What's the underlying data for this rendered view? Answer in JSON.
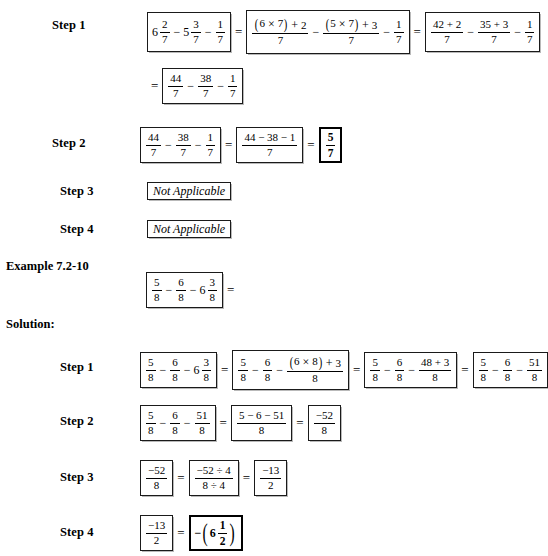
{
  "document": {
    "example_heading": "Example 7.2-10",
    "solution_heading": "Solution:",
    "equals": "=",
    "minus": "−",
    "times": "×",
    "plus": "+",
    "divide": "÷",
    "not_applicable": "Not Applicable"
  },
  "example_1": {
    "step1": {
      "label": "Step 1",
      "box1": {
        "m1_whole": "6",
        "m1_num": "2",
        "m1_den": "7",
        "m2_whole": "5",
        "m2_num": "3",
        "m2_den": "7",
        "f3_num": "1",
        "f3_den": "7"
      },
      "box2": {
        "f1_num": "(6 × 7) + 2",
        "f1_a": "6",
        "f1_b": "7",
        "f1_add": "2",
        "f1_den": "7",
        "f2_a": "5",
        "f2_b": "7",
        "f2_add": "3",
        "f2_den": "7",
        "f3_num": "1",
        "f3_den": "7"
      },
      "box3": {
        "f1_num": "42 + 2",
        "f1_den": "7",
        "f2_num": "35 + 3",
        "f2_den": "7",
        "f3_num": "1",
        "f3_den": "7"
      },
      "box4": {
        "f1_num": "44",
        "f1_den": "7",
        "f2_num": "38",
        "f2_den": "7",
        "f3_num": "1",
        "f3_den": "7"
      }
    },
    "step2": {
      "label": "Step 2",
      "box1": {
        "f1_num": "44",
        "f1_den": "7",
        "f2_num": "38",
        "f2_den": "7",
        "f3_num": "1",
        "f3_den": "7"
      },
      "box2": {
        "num": "44 − 38 − 1",
        "den": "7"
      },
      "box3": {
        "num": "5",
        "den": "7"
      }
    },
    "step3": {
      "label": "Step 3",
      "value": "Not Applicable"
    },
    "step4": {
      "label": "Step 4",
      "value": "Not Applicable"
    }
  },
  "example_2": {
    "problem": {
      "f1_num": "5",
      "f1_den": "8",
      "f2_num": "6",
      "f2_den": "8",
      "m_whole": "6",
      "m_num": "3",
      "m_den": "8"
    },
    "step1": {
      "label": "Step 1",
      "box1": {
        "f1_num": "5",
        "f1_den": "8",
        "f2_num": "6",
        "f2_den": "8",
        "m_whole": "6",
        "m_num": "3",
        "m_den": "8"
      },
      "box2": {
        "f1_num": "5",
        "f1_den": "8",
        "f2_num": "6",
        "f2_den": "8",
        "f3_a": "6",
        "f3_b": "8",
        "f3_add": "3",
        "f3_den": "8"
      },
      "box3": {
        "f1_num": "5",
        "f1_den": "8",
        "f2_num": "6",
        "f2_den": "8",
        "f3_num": "48 + 3",
        "f3_den": "8"
      },
      "box4": {
        "f1_num": "5",
        "f1_den": "8",
        "f2_num": "6",
        "f2_den": "8",
        "f3_num": "51",
        "f3_den": "8"
      }
    },
    "step2": {
      "label": "Step 2",
      "box1": {
        "f1_num": "5",
        "f1_den": "8",
        "f2_num": "6",
        "f2_den": "8",
        "f3_num": "51",
        "f3_den": "8"
      },
      "box2": {
        "num": "5 − 6 − 51",
        "den": "8"
      },
      "box3": {
        "num": "−52",
        "den": "8"
      }
    },
    "step3": {
      "label": "Step 3",
      "box1": {
        "num": "−52",
        "den": "8"
      },
      "box2": {
        "num": "−52 ÷ 4",
        "den": "8 ÷ 4"
      },
      "box3": {
        "num": "−13",
        "den": "2"
      }
    },
    "step4": {
      "label": "Step 4",
      "box1": {
        "num": "−13",
        "den": "2"
      },
      "box2": {
        "sign": "−",
        "whole": "6",
        "num": "1",
        "den": "2"
      }
    }
  }
}
